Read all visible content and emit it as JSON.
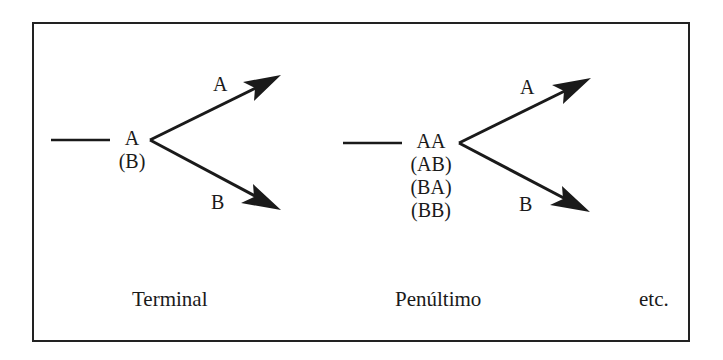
{
  "diagram": {
    "panels": [
      {
        "id": "terminal",
        "states": [
          "A",
          "(B)"
        ],
        "branch_up_label": "A",
        "branch_down_label": "B",
        "caption": "Terminal"
      },
      {
        "id": "penultimo",
        "states": [
          "AA",
          "(AB)",
          "(BA)",
          "(BB)"
        ],
        "branch_up_label": "A",
        "branch_down_label": "B",
        "caption": "Penúltimo"
      }
    ],
    "trailing_caption": "etc.",
    "colors": {
      "stroke": "#1a1a1a",
      "background": "#ffffff"
    }
  }
}
